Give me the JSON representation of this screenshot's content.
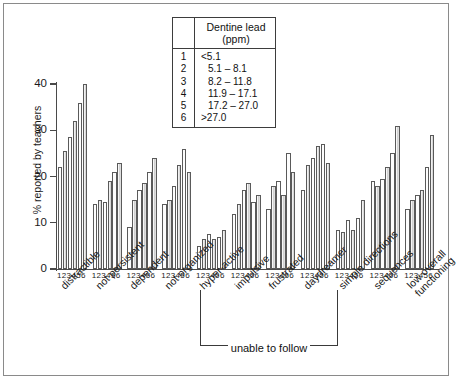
{
  "chart_data": {
    "type": "bar",
    "title": "",
    "xlabel": "",
    "ylabel": "% reported by teachers",
    "ylim": [
      0,
      40
    ],
    "yticks": [
      "0",
      "10",
      "20",
      "30",
      "40"
    ],
    "grid": false,
    "legend_position": "top-center-inset",
    "bar_index_labels": "123456",
    "categories": [
      "distractible",
      "not persistent",
      "dependent",
      "not organized",
      "hyper-active",
      "impulsive",
      "frustrated",
      "daydreamer",
      "simple directions",
      "sequences",
      "low overall functioning"
    ],
    "series": [
      {
        "name": "1",
        "dentine_lead_ppm": "<5.1",
        "values": [
          22,
          14,
          9,
          14,
          5,
          12,
          13,
          17,
          8.5,
          19,
          13
        ]
      },
      {
        "name": "2",
        "dentine_lead_ppm": "5.1 – 8.1",
        "values": [
          25.5,
          15,
          15,
          15,
          6.5,
          14,
          18,
          22.5,
          8,
          18,
          15
        ]
      },
      {
        "name": "3",
        "dentine_lead_ppm": "8.2 – 11.8",
        "values": [
          28.5,
          14.5,
          17,
          18,
          7.5,
          17,
          19,
          24,
          10.5,
          19.5,
          16
        ]
      },
      {
        "name": "4",
        "dentine_lead_ppm": "11.9 – 17.1",
        "values": [
          32,
          19,
          18.5,
          22.5,
          6.5,
          18.5,
          16,
          26.5,
          8.5,
          22,
          17
        ]
      },
      {
        "name": "5",
        "dentine_lead_ppm": "17.2 – 27.0",
        "values": [
          36,
          21,
          21,
          26,
          7,
          14.5,
          25,
          27,
          11,
          25,
          22
        ]
      },
      {
        "name": "6",
        "dentine_lead_ppm": ">27.0",
        "values": [
          40,
          23,
          24,
          21,
          8.5,
          16,
          21,
          23,
          15,
          31,
          29
        ]
      }
    ],
    "annotations": [
      {
        "name": "unable-to-follow-bracket",
        "text": "unable to follow",
        "spans": [
          "simple directions",
          "sequences"
        ]
      }
    ]
  },
  "legend": {
    "title_line1": "Dentine lead",
    "title_line2": "(ppm)",
    "rows": [
      {
        "index": "1",
        "range": "<5.1"
      },
      {
        "index": "2",
        "range": "5.1 – 8.1"
      },
      {
        "index": "3",
        "range": "8.2 – 11.8"
      },
      {
        "index": "4",
        "range": "11.9 – 17.1"
      },
      {
        "index": "5",
        "range": "17.2 – 27.0"
      },
      {
        "index": "6",
        "range": ">27.0"
      }
    ]
  },
  "colors": {
    "bar_fill_light": "#fdfdfd",
    "bar_fill_shaded": "#d6d6d6",
    "bar_stroke": "#5a5a5a",
    "axis": "#4a4a4a",
    "text": "#1a1a1a",
    "frame": "#8a8a8a"
  }
}
